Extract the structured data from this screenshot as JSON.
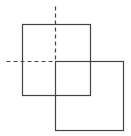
{
  "diagram": {
    "title": "",
    "stroke_color": "#444444",
    "background": "#ffffff",
    "shapes": [
      {
        "id": "square-1",
        "type": "rect",
        "x": 22,
        "y": 24,
        "width": 68,
        "height": 71
      },
      {
        "id": "square-2",
        "type": "rect",
        "x": 55,
        "y": 61,
        "width": 68,
        "height": 69
      }
    ],
    "guides": [
      {
        "id": "vertical-guide",
        "type": "dashed-line",
        "x1": 55,
        "y1": 6,
        "x2": 55,
        "y2": 61
      },
      {
        "id": "horizontal-guide",
        "type": "dashed-line",
        "x1": 6,
        "y1": 61,
        "x2": 55,
        "y2": 61
      }
    ],
    "dash_pattern": "4,3"
  }
}
